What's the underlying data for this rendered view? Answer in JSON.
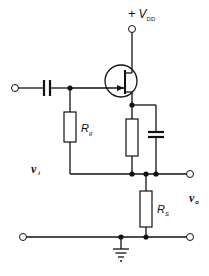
{
  "diagram": {
    "type": "circuit-schematic",
    "labels": {
      "supply_plus": "+",
      "supply_main": "V",
      "supply_sub": "DD",
      "rg_main": "R",
      "rg_sub": "g",
      "rs_main": "R",
      "rs_sub": "S",
      "vi_main": "v",
      "vi_sub": "i",
      "vo_main": "v",
      "vo_sub": "o"
    },
    "components": [
      {
        "id": "C1",
        "kind": "capacitor",
        "role": "input coupling"
      },
      {
        "id": "Q1",
        "kind": "n-channel JFET"
      },
      {
        "id": "Rg",
        "kind": "resistor",
        "label": "Rg"
      },
      {
        "id": "R1",
        "kind": "resistor",
        "role": "source resistor (unlabeled)"
      },
      {
        "id": "C2",
        "kind": "capacitor",
        "role": "bypass (unlabeled)"
      },
      {
        "id": "Rs",
        "kind": "resistor",
        "label": "RS"
      },
      {
        "id": "GND",
        "kind": "ground"
      }
    ],
    "colors": {
      "ink": "#111111",
      "background": "#ffffff"
    }
  }
}
